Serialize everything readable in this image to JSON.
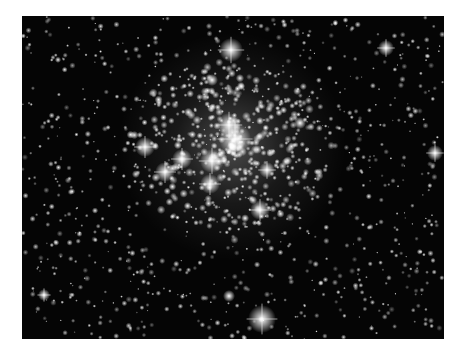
{
  "image": {
    "subject": "Star cluster on dark sky",
    "background_color": "#050505",
    "frame_color": "#ffffff",
    "cluster_center": [
      210,
      130
    ],
    "cluster_radius": 95,
    "bright_stars": [
      {
        "x": 209,
        "y": 34,
        "r": 6,
        "spikes": true
      },
      {
        "x": 364,
        "y": 32,
        "r": 4,
        "spikes": true
      },
      {
        "x": 190,
        "y": 64,
        "r": 3,
        "spikes": false
      },
      {
        "x": 207,
        "y": 109,
        "r": 6,
        "spikes": true
      },
      {
        "x": 213,
        "y": 123,
        "r": 8,
        "spikes": true
      },
      {
        "x": 123,
        "y": 131,
        "r": 5,
        "spikes": true
      },
      {
        "x": 160,
        "y": 143,
        "r": 5,
        "spikes": true
      },
      {
        "x": 190,
        "y": 145,
        "r": 6,
        "spikes": true
      },
      {
        "x": 143,
        "y": 156,
        "r": 5,
        "spikes": true
      },
      {
        "x": 188,
        "y": 168,
        "r": 5,
        "spikes": true
      },
      {
        "x": 245,
        "y": 154,
        "r": 4,
        "spikes": true
      },
      {
        "x": 238,
        "y": 194,
        "r": 5,
        "spikes": true
      },
      {
        "x": 278,
        "y": 107,
        "r": 3,
        "spikes": false
      },
      {
        "x": 413,
        "y": 137,
        "r": 4,
        "spikes": true
      },
      {
        "x": 22,
        "y": 279,
        "r": 3,
        "spikes": true
      },
      {
        "x": 240,
        "y": 303,
        "r": 7,
        "spikes": true
      },
      {
        "x": 207,
        "y": 280,
        "r": 3,
        "spikes": false
      }
    ],
    "field_star_count": 900,
    "cluster_star_count": 380
  }
}
